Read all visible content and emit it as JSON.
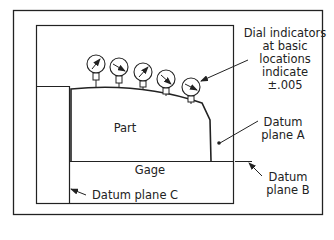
{
  "diagram": {
    "labels": {
      "dial_line1": "Dial indicators",
      "dial_line2": "at basic",
      "dial_line3": "locations",
      "dial_line4": "indicate",
      "dial_line5": "±.005",
      "part": "Part",
      "gage": "Gage",
      "datum_a_line1": "Datum",
      "datum_a_line2": "plane A",
      "datum_b_line1": "Datum",
      "datum_b_line2": "plane B",
      "datum_c": "Datum plane C"
    },
    "colors": {
      "line": "#222222",
      "background": "#ffffff"
    },
    "dial_indicator_count": 5
  }
}
